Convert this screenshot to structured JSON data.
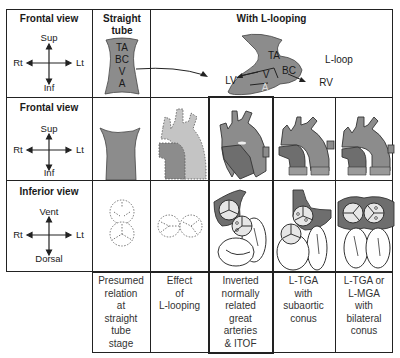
{
  "rows": [
    {
      "view": "Frontal view",
      "compass": {
        "up": "Sup",
        "down": "Inf",
        "left": "Rt",
        "right": "Lt"
      }
    },
    {
      "view": "Frontal view",
      "compass": {
        "up": "Sup",
        "down": "Inf",
        "left": "Rt",
        "right": "Lt"
      }
    },
    {
      "view": "Inferior view",
      "compass": {
        "up": "Vent",
        "down": "Dorsal",
        "left": "Rt",
        "right": "Lt"
      }
    }
  ],
  "header": {
    "straight_tube": "Straight tube",
    "with_l_looping": "With L-looping"
  },
  "straight_tube_labels": [
    "TA",
    "BC",
    "V",
    "A"
  ],
  "l_loop": {
    "label": "L-loop",
    "segments": {
      "ta": "TA",
      "bc": "BC",
      "v": "V",
      "a": "A"
    },
    "arrows": {
      "left": "LV",
      "right": "RV"
    }
  },
  "columns": [
    {
      "caption": [
        "Presumed",
        "relation",
        "at",
        "straight",
        "tube",
        "stage"
      ]
    },
    {
      "caption": [
        "Effect",
        "of",
        "L-looping"
      ]
    },
    {
      "caption": [
        "Inverted",
        "normally",
        "related",
        "great",
        "arteries",
        "& ITOF"
      ],
      "highlighted": true
    },
    {
      "caption": [
        "L-TGA",
        "with",
        "subaortic",
        "conus"
      ]
    },
    {
      "caption": [
        "L-TGA or",
        "L-MGA",
        "with",
        "bilateral",
        "conus"
      ]
    }
  ],
  "colors": {
    "grid": "#222222",
    "heart_fill": "#8c8c8c",
    "heart_dark": "#6e6e6e",
    "light_fill": "#c4c4c4",
    "valve_fill": "#e6e6e6"
  }
}
